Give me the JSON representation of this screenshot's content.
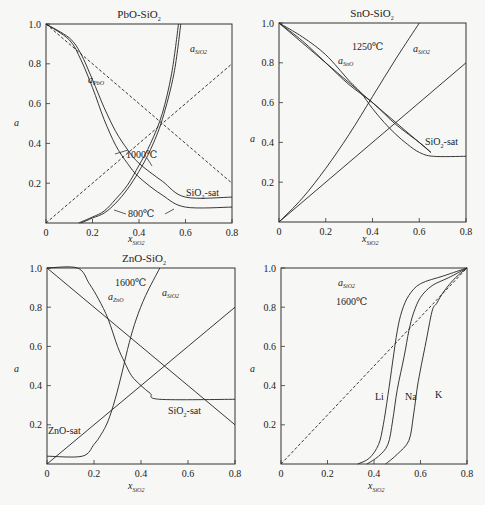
{
  "chart_data": [
    {
      "type": "line",
      "title": "PbO-SiO2",
      "xlabel": "x_SiO2",
      "ylabel": "a",
      "xlim": [
        0,
        0.8
      ],
      "ylim": [
        0,
        1.0
      ],
      "xticks": [
        "0",
        "0.2",
        "0.4",
        "0.6",
        "0.8"
      ],
      "yticks": [
        "0.2",
        "0.4",
        "0.6",
        "0.8",
        "1.0"
      ],
      "grid": false,
      "annotations": [
        "a_PbO",
        "a_SiO2",
        "1000℃",
        "800℃",
        "SiO2-sat"
      ],
      "series": [
        {
          "name": "a_PbO 1000℃",
          "style": "solid",
          "points": [
            [
              0,
              1.0
            ],
            [
              0.1,
              0.93
            ],
            [
              0.15,
              0.85
            ],
            [
              0.2,
              0.72
            ],
            [
              0.25,
              0.58
            ],
            [
              0.3,
              0.46
            ],
            [
              0.35,
              0.37
            ],
            [
              0.4,
              0.3
            ],
            [
              0.5,
              0.21
            ],
            [
              0.6,
              0.13
            ],
            [
              0.8,
              0.13
            ]
          ]
        },
        {
          "name": "a_PbO 800℃",
          "style": "solid",
          "points": [
            [
              0,
              1.0
            ],
            [
              0.1,
              0.92
            ],
            [
              0.15,
              0.82
            ],
            [
              0.2,
              0.68
            ],
            [
              0.25,
              0.52
            ],
            [
              0.3,
              0.39
            ],
            [
              0.35,
              0.3
            ],
            [
              0.4,
              0.23
            ],
            [
              0.5,
              0.14
            ],
            [
              0.6,
              0.08
            ],
            [
              0.8,
              0.08
            ]
          ]
        },
        {
          "name": "a_SiO2 1000℃",
          "style": "solid",
          "points": [
            [
              0.14,
              0
            ],
            [
              0.2,
              0.03
            ],
            [
              0.25,
              0.06
            ],
            [
              0.3,
              0.12
            ],
            [
              0.35,
              0.19
            ],
            [
              0.4,
              0.29
            ],
            [
              0.45,
              0.4
            ],
            [
              0.5,
              0.55
            ],
            [
              0.54,
              0.75
            ],
            [
              0.57,
              1.0
            ]
          ]
        },
        {
          "name": "a_SiO2 800℃",
          "style": "solid",
          "points": [
            [
              0.15,
              0
            ],
            [
              0.2,
              0.025
            ],
            [
              0.25,
              0.05
            ],
            [
              0.3,
              0.1
            ],
            [
              0.35,
              0.17
            ],
            [
              0.4,
              0.26
            ],
            [
              0.45,
              0.37
            ],
            [
              0.5,
              0.52
            ],
            [
              0.55,
              0.75
            ],
            [
              0.58,
              1.0
            ]
          ]
        },
        {
          "name": "ideal a_PbO",
          "style": "dashed",
          "points": [
            [
              0,
              1.0
            ],
            [
              0.8,
              0.2
            ]
          ]
        },
        {
          "name": "ideal a_SiO2",
          "style": "dashed",
          "points": [
            [
              0,
              0
            ],
            [
              0.8,
              0.8
            ]
          ]
        }
      ]
    },
    {
      "type": "line",
      "title": "SnO-SiO2",
      "xlabel": "x_SiO2",
      "ylabel": "a",
      "xlim": [
        0,
        0.8
      ],
      "ylim": [
        0,
        1.0
      ],
      "xticks": [
        "0",
        "0.2",
        "0.4",
        "0.6",
        "0.8"
      ],
      "yticks": [
        "0.2",
        "0.4",
        "0.6",
        "0.8",
        "1.0"
      ],
      "grid": false,
      "annotations": [
        "1250℃",
        "a_SnO",
        "a_SiO2",
        "SiO2-sat"
      ],
      "series": [
        {
          "name": "a_SnO",
          "style": "solid",
          "points": [
            [
              0,
              1.0
            ],
            [
              0.1,
              0.93
            ],
            [
              0.2,
              0.84
            ],
            [
              0.3,
              0.71
            ],
            [
              0.35,
              0.65
            ],
            [
              0.4,
              0.57
            ],
            [
              0.45,
              0.5
            ],
            [
              0.5,
              0.44
            ],
            [
              0.55,
              0.39
            ],
            [
              0.6,
              0.35
            ],
            [
              0.66,
              0.33
            ],
            [
              0.8,
              0.33
            ]
          ]
        },
        {
          "name": "a_SnO (alt)",
          "style": "solid",
          "points": [
            [
              0,
              1.0
            ],
            [
              0.1,
              0.91
            ],
            [
              0.2,
              0.8
            ],
            [
              0.3,
              0.69
            ],
            [
              0.4,
              0.6
            ],
            [
              0.5,
              0.49
            ],
            [
              0.6,
              0.4
            ],
            [
              0.65,
              0.35
            ]
          ]
        },
        {
          "name": "a_SiO2",
          "style": "solid",
          "points": [
            [
              0,
              0
            ],
            [
              0.1,
              0.12
            ],
            [
              0.2,
              0.27
            ],
            [
              0.3,
              0.44
            ],
            [
              0.4,
              0.63
            ],
            [
              0.5,
              0.82
            ],
            [
              0.6,
              1.0
            ]
          ]
        },
        {
          "name": "ideal a_SnO",
          "style": "solid-thin",
          "points": [
            [
              0,
              1.0
            ],
            [
              0.65,
              0.35
            ]
          ]
        },
        {
          "name": "ideal a_SiO2",
          "style": "solid-thin",
          "points": [
            [
              0,
              0
            ],
            [
              0.8,
              0.8
            ]
          ]
        }
      ]
    },
    {
      "type": "line",
      "title": "ZnO-SiO2",
      "xlabel": "x_SiO2",
      "ylabel": "a",
      "xlim": [
        0,
        0.8
      ],
      "ylim": [
        0,
        1.0
      ],
      "xticks": [
        "0",
        "0.2",
        "0.4",
        "0.6",
        "0.8"
      ],
      "yticks": [
        "0.2",
        "0.4",
        "0.6",
        "0.8",
        "1.0"
      ],
      "grid": false,
      "annotations": [
        "1600℃",
        "a_ZnO",
        "a_SiO2",
        "ZnO-sat",
        "SiO2-sat"
      ],
      "series": [
        {
          "name": "a_ZnO",
          "style": "solid",
          "points": [
            [
              0,
              1.0
            ],
            [
              0.13,
              1.0
            ],
            [
              0.18,
              0.92
            ],
            [
              0.22,
              0.84
            ],
            [
              0.26,
              0.74
            ],
            [
              0.3,
              0.6
            ],
            [
              0.33,
              0.52
            ],
            [
              0.36,
              0.45
            ],
            [
              0.4,
              0.4
            ],
            [
              0.44,
              0.36
            ],
            [
              0.48,
              0.33
            ],
            [
              0.8,
              0.33
            ]
          ]
        },
        {
          "name": "a_SiO2",
          "style": "solid",
          "points": [
            [
              0,
              0.04
            ],
            [
              0.15,
              0.04
            ],
            [
              0.2,
              0.1
            ],
            [
              0.23,
              0.15
            ],
            [
              0.26,
              0.22
            ],
            [
              0.29,
              0.33
            ],
            [
              0.32,
              0.47
            ],
            [
              0.35,
              0.62
            ],
            [
              0.38,
              0.74
            ],
            [
              0.42,
              0.86
            ],
            [
              0.48,
              1.0
            ]
          ]
        },
        {
          "name": "ideal a_ZnO",
          "style": "solid",
          "points": [
            [
              0,
              1.0
            ],
            [
              0.8,
              0.2
            ]
          ]
        },
        {
          "name": "ideal a_SiO2",
          "style": "solid",
          "points": [
            [
              0,
              0
            ],
            [
              0.8,
              0.8
            ]
          ]
        }
      ]
    },
    {
      "type": "line",
      "title": "",
      "xlabel": "x_SiO2",
      "ylabel": "a",
      "xlim": [
        0,
        0.8
      ],
      "ylim": [
        0,
        1.0
      ],
      "xticks": [
        "0",
        "0.2",
        "0.4",
        "0.6",
        "0.8"
      ],
      "yticks": [
        "0.2",
        "0.4",
        "0.6",
        "0.8",
        "1.0"
      ],
      "grid": false,
      "annotations": [
        "a_SiO2",
        "1600℃",
        "Li",
        "Na",
        "K"
      ],
      "series": [
        {
          "name": "Li",
          "style": "solid",
          "points": [
            [
              0.33,
              0
            ],
            [
              0.38,
              0.03
            ],
            [
              0.42,
              0.1
            ],
            [
              0.44,
              0.2
            ],
            [
              0.46,
              0.35
            ],
            [
              0.48,
              0.52
            ],
            [
              0.5,
              0.68
            ],
            [
              0.52,
              0.78
            ],
            [
              0.55,
              0.86
            ],
            [
              0.6,
              0.92
            ],
            [
              0.7,
              0.96
            ],
            [
              0.8,
              1.0
            ]
          ]
        },
        {
          "name": "Na",
          "style": "solid",
          "points": [
            [
              0.37,
              0
            ],
            [
              0.42,
              0.04
            ],
            [
              0.46,
              0.1
            ],
            [
              0.48,
              0.22
            ],
            [
              0.5,
              0.38
            ],
            [
              0.53,
              0.55
            ],
            [
              0.55,
              0.68
            ],
            [
              0.57,
              0.77
            ],
            [
              0.6,
              0.85
            ],
            [
              0.65,
              0.91
            ],
            [
              0.72,
              0.95
            ],
            [
              0.8,
              1.0
            ]
          ]
        },
        {
          "name": "K",
          "style": "solid",
          "points": [
            [
              0.45,
              0
            ],
            [
              0.5,
              0.05
            ],
            [
              0.55,
              0.12
            ],
            [
              0.57,
              0.25
            ],
            [
              0.59,
              0.42
            ],
            [
              0.62,
              0.6
            ],
            [
              0.65,
              0.78
            ],
            [
              0.67,
              0.82
            ],
            [
              0.7,
              0.88
            ],
            [
              0.75,
              0.95
            ],
            [
              0.8,
              1.0
            ]
          ]
        },
        {
          "name": "ideal",
          "style": "dashed",
          "points": [
            [
              0,
              0
            ],
            [
              0.8,
              1.0
            ]
          ]
        }
      ]
    }
  ],
  "panels": [
    {
      "title": "PbO-SiO",
      "title_sub": "2",
      "ylabel": "a",
      "xlabel": "x",
      "xlabel_sub": "SiO2",
      "labels": {
        "a_main": "a",
        "a_main_sub": "PbO",
        "a_si": "a",
        "a_si_sub": "SiO2",
        "t1": "1000℃",
        "t2": "800℃",
        "sat": "SiO",
        "sat_sub": "2",
        "sat_tail": "-sat"
      }
    },
    {
      "title": "SnO-SiO",
      "title_sub": "2",
      "ylabel": "a",
      "xlabel": "x",
      "xlabel_sub": "SiO2",
      "labels": {
        "temp": "1250℃",
        "a_main": "a",
        "a_main_sub": "SnO",
        "a_si": "a",
        "a_si_sub": "SiO2",
        "sat": "SiO",
        "sat_sub": "2",
        "sat_tail": "-sat"
      }
    },
    {
      "title": "ZnO-SiO",
      "title_sub": "2",
      "ylabel": "a",
      "xlabel": "x",
      "xlabel_sub": "SiO2",
      "labels": {
        "temp": "1600℃",
        "a_main": "a",
        "a_main_sub": "ZnO",
        "a_si": "a",
        "a_si_sub": "SiO2",
        "zsat": "ZnO-sat",
        "sat": "SiO",
        "sat_sub": "2",
        "sat_tail": "-sat"
      }
    },
    {
      "title": "",
      "ylabel": "a",
      "xlabel": "x",
      "xlabel_sub": "SiO2",
      "labels": {
        "a_si": "a",
        "a_si_sub": "SiO2",
        "temp": "1600℃",
        "li": "Li",
        "na": "Na",
        "k": "K"
      }
    }
  ],
  "ticks": {
    "x": [
      "0",
      "0.2",
      "0.4",
      "0.6",
      "0.8"
    ],
    "y": [
      "0.2",
      "0.4",
      "0.6",
      "0.8",
      "1.0"
    ]
  }
}
